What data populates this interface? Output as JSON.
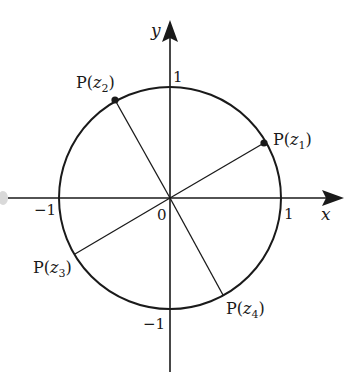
{
  "figure": {
    "origin_label": "0",
    "axes": {
      "x_label": "x",
      "y_label": "y",
      "ticks": {
        "x_pos": "1",
        "x_neg": "−1",
        "y_pos": "1",
        "y_neg": "−1"
      }
    },
    "points": [
      {
        "id": "z1",
        "label_prefix": "P(",
        "var": "z",
        "sub": "1",
        "label_suffix": ")",
        "dot": true
      },
      {
        "id": "z2",
        "label_prefix": "P(",
        "var": "z",
        "sub": "2",
        "label_suffix": ")",
        "dot": true
      },
      {
        "id": "z3",
        "label_prefix": "P(",
        "var": "z",
        "sub": "3",
        "label_suffix": ")",
        "dot": false
      },
      {
        "id": "z4",
        "label_prefix": "P(",
        "var": "z",
        "sub": "4",
        "label_suffix": ")",
        "dot": false
      }
    ],
    "colors": {
      "ink": "#1a1a1a",
      "background": "#ffffff"
    }
  }
}
